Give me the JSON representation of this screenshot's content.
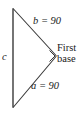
{
  "figure": {
    "background_color": "#ffffff",
    "stroke_color": "#3a3a3a",
    "text_color": "#1a1a1a"
  },
  "labels": {
    "side_c": "c",
    "side_b": "b = 90",
    "side_a": "a = 90",
    "vertex_line1": "First",
    "vertex_line2": "base"
  },
  "diagram_data": {
    "type": "geometry-triangle",
    "shape": "right triangle",
    "vertices": [
      {
        "name": "top-left",
        "x": 13,
        "y": 9
      },
      {
        "name": "right",
        "x": 56,
        "y": 56
      },
      {
        "name": "bottom-left",
        "x": 13,
        "y": 107
      }
    ],
    "sides": [
      {
        "label": "c",
        "value": null,
        "from": "top-left",
        "to": "bottom-left",
        "orientation": "vertical"
      },
      {
        "label": "b",
        "value": 90,
        "from": "top-left",
        "to": "right",
        "orientation": "diagonal-down-right"
      },
      {
        "label": "a",
        "value": 90,
        "from": "right",
        "to": "bottom-left",
        "orientation": "diagonal-down-left"
      }
    ],
    "right_angle_at": "right",
    "annotations": [
      {
        "text": "First base",
        "at_vertex": "right"
      }
    ]
  }
}
